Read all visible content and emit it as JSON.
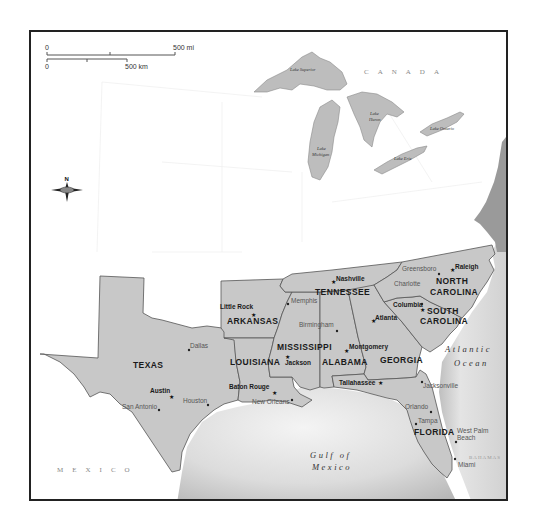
{
  "scale_bar": {
    "mi_start": "0",
    "mi_end": "500 mi",
    "km_start": "0",
    "km_end": "500 km"
  },
  "compass": {
    "north_label": "N"
  },
  "countries": {
    "canada": "CANADA",
    "mexico": "MEXICO"
  },
  "water_bodies": {
    "lake_superior": "Lake Superior",
    "lake_michigan_1": "Lake",
    "lake_michigan_2": "Michigan",
    "lake_huron_1": "Lake",
    "lake_huron_2": "Huron",
    "lake_ontario": "Lake Ontario",
    "lake_erie": "Lake Erie",
    "gulf_1": "Gulf of",
    "gulf_2": "Mexico",
    "atlantic_1": "Atlantic",
    "atlantic_2": "Ocean",
    "bahamas": "BAHAMAS"
  },
  "states": [
    {
      "id": "tx",
      "label": "TEXAS"
    },
    {
      "id": "ar",
      "label": "ARKANSAS"
    },
    {
      "id": "la",
      "label": "LOUISIANA"
    },
    {
      "id": "ms",
      "label": "MISSISSIPPI"
    },
    {
      "id": "al",
      "label": "ALABAMA"
    },
    {
      "id": "tn",
      "label": "TENNESSEE"
    },
    {
      "id": "ga",
      "label": "GEORGIA"
    },
    {
      "id": "fl",
      "label": "FLORIDA"
    },
    {
      "id": "sc",
      "label_1": "SOUTH",
      "label_2": "CAROLINA"
    },
    {
      "id": "nc",
      "label_1": "NORTH",
      "label_2": "CAROLINA"
    }
  ],
  "capitals": [
    {
      "name": "Austin"
    },
    {
      "name": "Little Rock"
    },
    {
      "name": "Baton Rouge"
    },
    {
      "name": "Jackson"
    },
    {
      "name": "Montgomery"
    },
    {
      "name": "Nashville"
    },
    {
      "name": "Atlanta"
    },
    {
      "name": "Tallahassee"
    },
    {
      "name": "Columbia"
    },
    {
      "name": "Raleigh"
    }
  ],
  "cities": [
    {
      "name": "Dallas"
    },
    {
      "name": "Houston"
    },
    {
      "name": "San Antonio"
    },
    {
      "name": "New Orleans"
    },
    {
      "name": "Memphis"
    },
    {
      "name": "Birmingham"
    },
    {
      "name": "Charlotte"
    },
    {
      "name": "Greensboro"
    },
    {
      "name": "Jacksonville"
    },
    {
      "name": "Orlando"
    },
    {
      "name": "Tampa"
    },
    {
      "name": "West Palm"
    },
    {
      "name": "Beach"
    },
    {
      "name": "Miami"
    }
  ]
}
